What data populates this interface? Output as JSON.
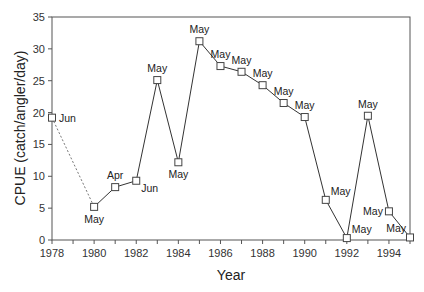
{
  "chart_data": {
    "type": "line",
    "title": "",
    "xlabel": "Year",
    "ylabel": "CPUE (catch/angler/day)",
    "xlim": [
      1978,
      1995
    ],
    "ylim": [
      0,
      35
    ],
    "xticks": [
      1978,
      1980,
      1982,
      1984,
      1986,
      1988,
      1990,
      1992,
      1994
    ],
    "xminor_step": 1,
    "yticks": [
      0,
      5,
      10,
      15,
      20,
      25,
      30,
      35
    ],
    "grid": false,
    "legend": null,
    "marker": "open-square",
    "line_color": "#333333",
    "points": [
      {
        "x": 1978,
        "y": 19.2,
        "label": "Jun",
        "label_pos": "right"
      },
      {
        "x": 1980,
        "y": 5.2,
        "label": "May",
        "label_pos": "below"
      },
      {
        "x": 1981,
        "y": 8.3,
        "label": "Apr",
        "label_pos": "above"
      },
      {
        "x": 1982,
        "y": 9.3,
        "label": "Jun",
        "label_pos": "below-right"
      },
      {
        "x": 1983,
        "y": 25.1,
        "label": "May",
        "label_pos": "above"
      },
      {
        "x": 1984,
        "y": 12.2,
        "label": "May",
        "label_pos": "below"
      },
      {
        "x": 1985,
        "y": 31.2,
        "label": "May",
        "label_pos": "above"
      },
      {
        "x": 1986,
        "y": 27.3,
        "label": "May",
        "label_pos": "above"
      },
      {
        "x": 1987,
        "y": 26.4,
        "label": "May",
        "label_pos": "above"
      },
      {
        "x": 1988,
        "y": 24.3,
        "label": "May",
        "label_pos": "above"
      },
      {
        "x": 1989,
        "y": 21.5,
        "label": "May",
        "label_pos": "above"
      },
      {
        "x": 1990,
        "y": 19.3,
        "label": "May",
        "label_pos": "above"
      },
      {
        "x": 1991,
        "y": 6.3,
        "label": "May",
        "label_pos": "above-right"
      },
      {
        "x": 1992,
        "y": 0.3,
        "label": "May",
        "label_pos": "above-right"
      },
      {
        "x": 1993,
        "y": 19.5,
        "label": "May",
        "label_pos": "above"
      },
      {
        "x": 1994,
        "y": 4.5,
        "label": "May",
        "label_pos": "left"
      },
      {
        "x": 1995,
        "y": 0.4,
        "label": "May",
        "label_pos": "above-left"
      }
    ],
    "segments_style": [
      {
        "from": 1978,
        "to": 1980,
        "style": "dotted"
      },
      {
        "from": 1980,
        "to": 1995,
        "style": "solid"
      }
    ]
  }
}
